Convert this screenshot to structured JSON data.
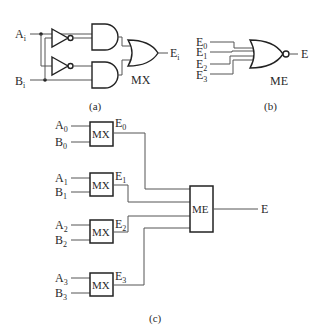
{
  "diagram_a": {
    "caption": "(a)",
    "inputs": [
      {
        "name": "A",
        "sub": "i"
      },
      {
        "name": "B",
        "sub": "i"
      }
    ],
    "output": {
      "name": "E",
      "sub": "i"
    },
    "gate_label": "MX",
    "gates": [
      "inverter",
      "inverter",
      "and",
      "and",
      "or"
    ]
  },
  "diagram_b": {
    "caption": "(b)",
    "inputs": [
      {
        "name": "E",
        "sub": "0"
      },
      {
        "name": "E",
        "sub": "1"
      },
      {
        "name": "E",
        "sub": "2"
      },
      {
        "name": "E",
        "sub": "3"
      }
    ],
    "output": {
      "name": "E"
    },
    "gate_label": "ME",
    "gates": [
      "nor"
    ]
  },
  "diagram_c": {
    "caption": "(c)",
    "mx_blocks": [
      {
        "label": "MX",
        "in_a": {
          "name": "A",
          "sub": "0"
        },
        "in_b": {
          "name": "B",
          "sub": "0"
        },
        "out": {
          "name": "E",
          "sub": "0"
        }
      },
      {
        "label": "MX",
        "in_a": {
          "name": "A",
          "sub": "1"
        },
        "in_b": {
          "name": "B",
          "sub": "1"
        },
        "out": {
          "name": "E",
          "sub": "1"
        }
      },
      {
        "label": "MX",
        "in_a": {
          "name": "A",
          "sub": "2"
        },
        "in_b": {
          "name": "B",
          "sub": "2"
        },
        "out": {
          "name": "E",
          "sub": "2"
        }
      },
      {
        "label": "MX",
        "in_a": {
          "name": "A",
          "sub": "3"
        },
        "in_b": {
          "name": "B",
          "sub": "3"
        },
        "out": {
          "name": "E",
          "sub": "3"
        }
      }
    ],
    "me_block": {
      "label": "ME"
    },
    "output": {
      "name": "E"
    }
  }
}
